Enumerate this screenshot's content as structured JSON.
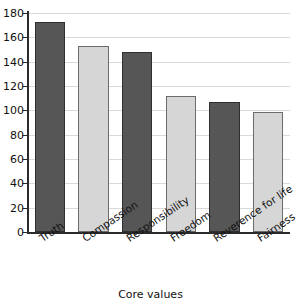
{
  "chart_data": {
    "type": "bar",
    "title": "",
    "xlabel": "Core values",
    "ylabel": "",
    "categories": [
      "Truth",
      "Compassion",
      "Responsibility",
      "Freedom",
      "Reverence for life",
      "Fairness"
    ],
    "values": [
      173,
      153,
      148,
      112,
      107,
      99
    ],
    "series": [
      {
        "name": "Core values count",
        "values": [
          173,
          153,
          148,
          112,
          107,
          99
        ]
      }
    ],
    "bar_colors": [
      "#565656",
      "#d6d6d6",
      "#565656",
      "#d6d6d6",
      "#565656",
      "#d6d6d6"
    ],
    "ylim": [
      0,
      180
    ],
    "ytick_step": 20,
    "yticks": [
      0,
      20,
      40,
      60,
      80,
      100,
      120,
      140,
      160,
      180
    ],
    "ytick_labels": [
      "0",
      "20",
      "40",
      "60",
      "80",
      "100",
      "120",
      "140",
      "160",
      "180"
    ],
    "grid": true,
    "grid_axis": "y",
    "legend": false,
    "legend_position": "none",
    "xlabel_rotation": -34,
    "colors": {
      "dark_bar": "#565656",
      "light_bar": "#d6d6d6",
      "gridline": "#d9d9d9",
      "axis": "#2b2b2b",
      "text": "#111111",
      "background": "#ffffff"
    }
  }
}
